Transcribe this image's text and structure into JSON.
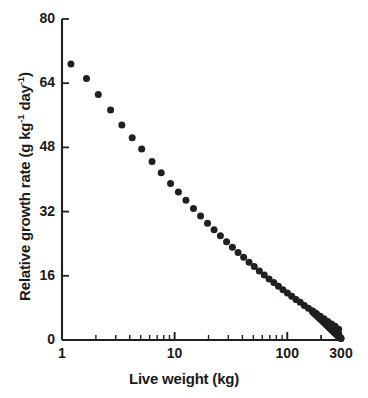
{
  "chart_data": {
    "type": "scatter",
    "title": "",
    "xlabel": "Live weight (kg)",
    "ylabel_plain": "Relative growth rate (g kg-1 day-1)",
    "ylabel_parts": {
      "lead": "Relative growth rate (g kg",
      "exp1": "-1",
      "mid": " day",
      "exp2": "-1",
      "tail": ")"
    },
    "xscale": "log",
    "yscale": "linear",
    "xlim": [
      1,
      300
    ],
    "ylim": [
      0,
      80
    ],
    "xticks": [
      1,
      10,
      100,
      300
    ],
    "xticklabels": [
      "1",
      "10",
      "100",
      "300"
    ],
    "yticks": [
      0,
      16,
      32,
      48,
      64,
      80
    ],
    "yticklabels": [
      "0",
      "16",
      "32",
      "48",
      "64",
      "80"
    ],
    "grid": false,
    "legend": null,
    "marker": {
      "shape": "circle",
      "color": "#231f20",
      "size_px": 7
    },
    "series": [
      {
        "name": "Relative growth rate",
        "x": [
          1.2,
          1.65,
          2.1,
          2.7,
          3.4,
          4.2,
          5.1,
          6.3,
          7.6,
          9.2,
          10.8,
          12.6,
          14.7,
          17.0,
          19.6,
          22.4,
          25.5,
          28.9,
          32.6,
          36.6,
          41.0,
          45.8,
          50.9,
          56.5,
          62.5,
          69.0,
          76.0,
          83.5,
          91.6,
          100.3,
          109.6,
          119.6,
          130.3,
          141.8,
          154.1,
          167.2,
          181.2,
          196.1,
          212.0,
          228.9,
          246.8,
          265.8,
          286.0,
          300.0
        ],
        "y": [
          68.8,
          65.2,
          61.2,
          57.3,
          53.6,
          50.4,
          47.6,
          44.5,
          41.7,
          39.0,
          36.9,
          34.8,
          32.8,
          30.9,
          29.1,
          27.5,
          26.0,
          24.5,
          23.1,
          21.8,
          20.6,
          19.4,
          18.3,
          17.2,
          16.2,
          15.2,
          14.3,
          13.4,
          12.5,
          11.7,
          10.9,
          10.1,
          9.4,
          8.6,
          7.9,
          7.2,
          6.6,
          5.9,
          5.3,
          4.6,
          4.0,
          3.4,
          2.7,
          0.4
        ]
      }
    ]
  }
}
